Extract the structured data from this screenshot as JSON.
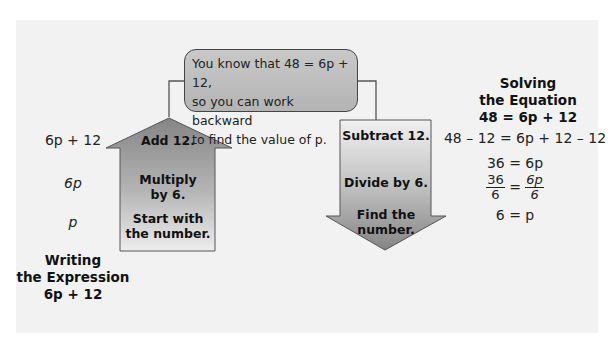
{
  "callout": {
    "lines": [
      "You know that 48 = 6p + 12,",
      "so you can work backward",
      "to find the value of p."
    ]
  },
  "writing": {
    "expressions": [
      "6p + 12",
      "6p",
      "p"
    ],
    "title_line1": "Writing",
    "title_line2": "the Expression",
    "title_line3": "6p + 12"
  },
  "up_arrow": {
    "steps": [
      "Add 12.",
      "Multiply by 6.",
      "Start with the number."
    ],
    "step_lines": [
      [
        "Add 12."
      ],
      [
        "Multiply",
        "by 6."
      ],
      [
        "Start with",
        "the number."
      ]
    ]
  },
  "down_arrow": {
    "steps": [
      "Subtract 12.",
      "Divide by 6.",
      "Find the number."
    ],
    "step_lines": [
      [
        "Subtract 12."
      ],
      [
        "Divide by 6."
      ],
      [
        "Find the",
        "number."
      ]
    ]
  },
  "solving": {
    "title_line1": "Solving",
    "title_line2": "the Equation",
    "title_line3": "48 = 6p + 12",
    "steps": [
      "48 – 12 = 6p + 12 – 12",
      "36 = 6p",
      "36/6 = 6p/6",
      "6 = p"
    ],
    "fraction": {
      "left_num": "36",
      "left_den": "6",
      "right_num": "6p",
      "right_den": "6",
      "equals": "="
    }
  },
  "colors": {
    "panel_bg": "#f2f2f2",
    "arrow_dark": "#8a8a8a",
    "arrow_light": "#ececec",
    "callout_fill": "#bdbdbd",
    "stroke": "#444444"
  }
}
